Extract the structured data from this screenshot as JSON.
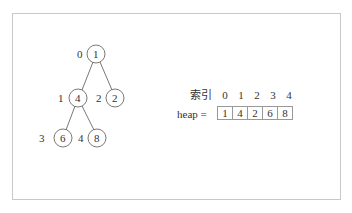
{
  "diagram": {
    "type": "binary-heap",
    "tree": {
      "nodes": [
        {
          "index": "0",
          "value": "1",
          "cx": 96,
          "cy": 54
        },
        {
          "index": "1",
          "value": "4",
          "cx": 78,
          "cy": 98
        },
        {
          "index": "2",
          "value": "2",
          "cx": 115,
          "cy": 98
        },
        {
          "index": "3",
          "value": "6",
          "cx": 63,
          "cy": 138
        },
        {
          "index": "4",
          "value": "8",
          "cx": 97,
          "cy": 138
        }
      ],
      "edges": [
        [
          0,
          1
        ],
        [
          0,
          2
        ],
        [
          1,
          3
        ],
        [
          1,
          4
        ]
      ]
    },
    "array": {
      "index_label": "索引",
      "indices": [
        "0",
        "1",
        "2",
        "3",
        "4"
      ],
      "name_label": "heap =",
      "values": [
        "1",
        "4",
        "2",
        "6",
        "8"
      ]
    }
  }
}
